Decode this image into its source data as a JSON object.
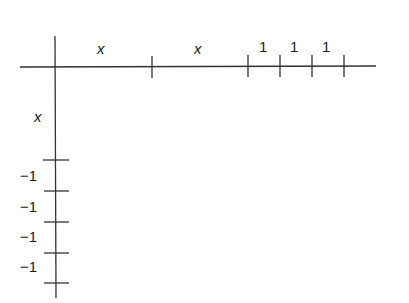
{
  "diagram": {
    "horizontal": {
      "segments": [
        {
          "label": "x"
        },
        {
          "label": "x"
        },
        {
          "label": "1"
        },
        {
          "label": "1"
        },
        {
          "label": "1"
        }
      ]
    },
    "vertical": {
      "segments": [
        {
          "label": "x"
        },
        {
          "label": "−1"
        },
        {
          "label": "−1"
        },
        {
          "label": "−1"
        },
        {
          "label": "−1"
        }
      ]
    },
    "line_color": "#333333"
  }
}
